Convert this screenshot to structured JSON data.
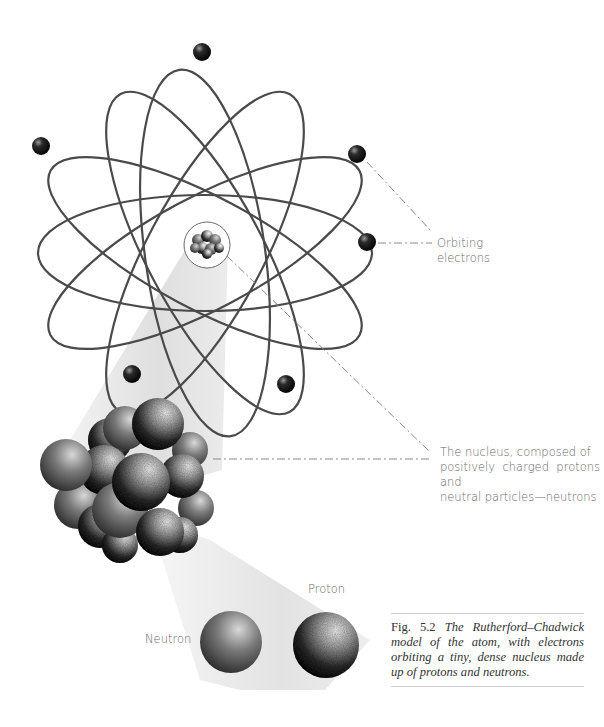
{
  "figure": {
    "number": "Fig. 5.2",
    "caption": "The Rutherford–Chadwick model of the atom, with electrons orbiting a tiny, dense nucleus made up of protons and neutrons."
  },
  "labels": {
    "orbiting_electrons": [
      "Orbiting",
      "electrons"
    ],
    "nucleus": [
      "The nucleus, composed of",
      "positively charged protons and",
      "neutral particles—neutrons"
    ],
    "proton": "Proton",
    "neutron": "Neutron"
  },
  "colors": {
    "orbit": "#4a4a4a",
    "electron": "#1a1a1a",
    "label_text": "#6a6a6a",
    "leader_line": "#8a8a8a",
    "beam": "#dcdcdc",
    "caption_rule": "#cfcfcf"
  }
}
